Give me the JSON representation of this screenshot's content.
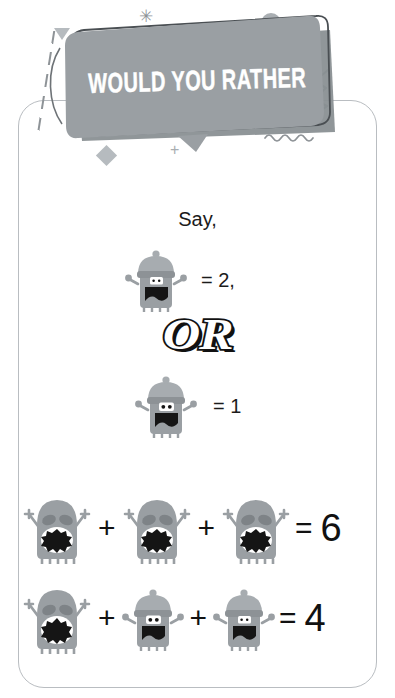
{
  "page": {
    "type": "worksheet-card",
    "background": "#ffffff",
    "card_border_color": "#b9bdc1"
  },
  "banner": {
    "title": "WOULD YOU RATHER",
    "fill_color": "#9a9fa3",
    "shadow_color": "#8a9094",
    "outline_color": "#3f4447",
    "text_color": "#ffffff"
  },
  "decorations": [
    {
      "name": "triangle",
      "color": "#b6bbbf"
    },
    {
      "name": "asterisk",
      "glyph": "✳",
      "color": "#8e9397"
    },
    {
      "name": "dashed-line",
      "color": "#8e9397"
    },
    {
      "name": "dash-marks",
      "color": "#9ea3a7"
    },
    {
      "name": "circle",
      "color": "#a9aeb2"
    },
    {
      "name": "zigzag",
      "color": "#7d8287"
    },
    {
      "name": "squiggle",
      "color": "#8e9397"
    },
    {
      "name": "diamond",
      "color": "#b6bbbf"
    },
    {
      "name": "plus",
      "glyph": "+",
      "color": "#a9aeb2"
    }
  ],
  "prompt": {
    "say_label": "Say,",
    "or_label": "OR",
    "assign_1": "= 2,",
    "assign_2": "= 1"
  },
  "legend": [
    {
      "monster": "beanie-one-eye",
      "value": "= 2,"
    },
    {
      "monster": "beanie-two-eye",
      "value": "= 1"
    }
  ],
  "equations": [
    {
      "id": "equation-1",
      "terms": [
        "round-toothy",
        "round-toothy",
        "round-toothy"
      ],
      "operators": [
        "+",
        "+"
      ],
      "equals": "=",
      "result": "6"
    },
    {
      "id": "equation-2",
      "terms": [
        "round-toothy",
        "beanie-two-eye",
        "beanie-one-eye"
      ],
      "operators": [
        "+",
        "+"
      ],
      "equals": "=",
      "result": "4"
    }
  ],
  "monster_colors": {
    "body": "#9a9fa3",
    "body_dark": "#83888c",
    "hat": "#a7acb0",
    "hat_band": "#8d9296",
    "mouth": "#151515",
    "tooth": "#ffffff",
    "eye": "#ffffff",
    "pupil": "#151515"
  }
}
